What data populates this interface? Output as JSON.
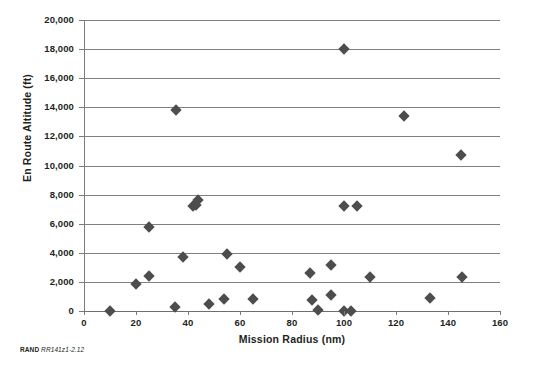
{
  "figure": {
    "credit_brand": "RAND",
    "credit_id": "RR141z1-2.12"
  },
  "chart_data": {
    "type": "scatter",
    "title": "",
    "xlabel": "Mission Radius (nm)",
    "ylabel": "En Route Altitude (ft)",
    "xlim": [
      0,
      160
    ],
    "ylim": [
      0,
      20000
    ],
    "xticks": [
      0,
      20,
      40,
      60,
      80,
      100,
      120,
      140,
      160
    ],
    "xtick_labels": [
      "0",
      "20",
      "40",
      "60",
      "80",
      "100",
      "120",
      "140",
      "160"
    ],
    "yticks": [
      0,
      2000,
      4000,
      6000,
      8000,
      10000,
      12000,
      14000,
      16000,
      18000,
      20000
    ],
    "ytick_labels": [
      "0",
      "2,000",
      "4,000",
      "6,000",
      "8,000",
      "10,000",
      "12,000",
      "14,000",
      "16,000",
      "18,000",
      "20,000"
    ],
    "grid": "horizontal",
    "legend": "none",
    "marker_shape": "diamond",
    "marker_color": "#4d4d4d",
    "series": [
      {
        "name": "Missions",
        "points": [
          [
            10,
            0
          ],
          [
            20,
            1850
          ],
          [
            25,
            2400
          ],
          [
            25,
            5750
          ],
          [
            35,
            250
          ],
          [
            35.5,
            13800
          ],
          [
            38,
            3700
          ],
          [
            42,
            7250
          ],
          [
            43,
            7300
          ],
          [
            44,
            7650
          ],
          [
            48,
            500
          ],
          [
            54,
            800
          ],
          [
            55,
            3900
          ],
          [
            60,
            3000
          ],
          [
            65,
            850
          ],
          [
            87,
            2600
          ],
          [
            87.5,
            750
          ],
          [
            90,
            50
          ],
          [
            95,
            3150
          ],
          [
            95,
            1100
          ],
          [
            100,
            0
          ],
          [
            100,
            18000
          ],
          [
            100,
            7200
          ],
          [
            102.5,
            0
          ],
          [
            105,
            7200
          ],
          [
            110,
            2350
          ],
          [
            123,
            13400
          ],
          [
            133,
            900
          ],
          [
            145,
            10700
          ],
          [
            145.5,
            2350
          ]
        ]
      }
    ]
  }
}
